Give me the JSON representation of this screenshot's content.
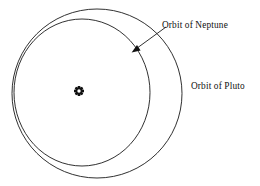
{
  "figure": {
    "type": "orbital-diagram",
    "background_color": "#ffffff",
    "stroke_color": "#1a1a1a",
    "text_color": "#111111"
  },
  "labels": {
    "neptune": "Orbit of Neptune",
    "pluto": "Orbit of Pluto"
  },
  "center_marker": {
    "name": "sun-symbol",
    "glyph": "sun-icon",
    "x": 79,
    "y": 91
  },
  "orbits": [
    {
      "name": "neptune-orbit",
      "label": "Orbit of Neptune",
      "cx": 82,
      "cy": 92.5,
      "rx": 68,
      "ry": 73.5
    },
    {
      "name": "pluto-orbit",
      "label": "Orbit of Pluto",
      "cx": 97,
      "cy": 93.5,
      "rx": 85,
      "ry": 84.5
    }
  ],
  "annotation": {
    "name": "neptune-leader",
    "line_from_x": 166,
    "line_from_y": 27,
    "line_to_x": 134,
    "line_to_y": 50,
    "arrow_tip_x": 132,
    "arrow_tip_y": 52
  }
}
